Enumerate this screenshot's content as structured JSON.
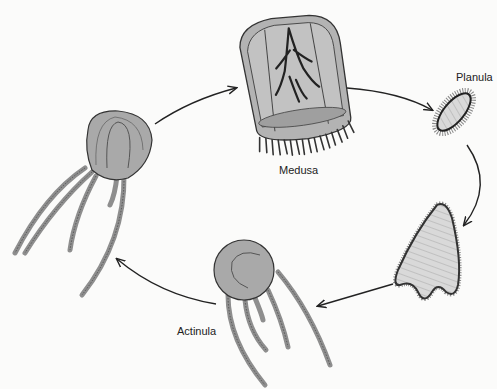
{
  "diagram": {
    "type": "life-cycle",
    "stages": [
      {
        "id": "medusa",
        "label": "Medusa"
      },
      {
        "id": "planula",
        "label": "Planula"
      },
      {
        "id": "polyp",
        "label": ""
      },
      {
        "id": "actinula",
        "label": "Actinula"
      },
      {
        "id": "juvenile-medusa",
        "label": ""
      }
    ],
    "arrows": [
      {
        "from": "juvenile-medusa",
        "to": "medusa"
      },
      {
        "from": "medusa",
        "to": "planula"
      },
      {
        "from": "planula",
        "to": "polyp"
      },
      {
        "from": "polyp",
        "to": "actinula"
      },
      {
        "from": "actinula",
        "to": "juvenile-medusa"
      }
    ],
    "colors": {
      "body_fill": "#a9a9a9",
      "outline": "#333333",
      "inner_fill": "#bcbcbc",
      "light_fill": "#d8d8d8",
      "background": "#fbfbfa"
    }
  }
}
